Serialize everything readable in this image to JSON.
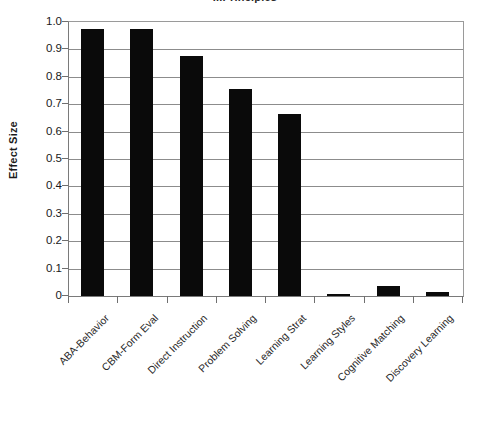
{
  "chart_data": {
    "type": "bar",
    "title": "...Principles",
    "xlabel": "",
    "ylabel": "Effect Size",
    "ylim": [
      0,
      1.0
    ],
    "grid": true,
    "legend": "none",
    "categories": [
      "ABA-Behavior",
      "CBM-Form Eval",
      "Direct Instruction",
      "Problem Solving",
      "Learning Strat",
      "Learning Styles",
      "Cognitive Matching",
      "Discovery Learning"
    ],
    "values": [
      0.975,
      0.975,
      0.875,
      0.755,
      0.665,
      0.008,
      0.038,
      0.015
    ],
    "ytick_labels": [
      "1.0",
      "0.9",
      "0.8",
      "0.7",
      "0.6",
      "0.5",
      "0.4",
      "0.3",
      "0.2",
      "0.1",
      "0"
    ],
    "ytick_values": [
      1.0,
      0.9,
      0.8,
      0.7,
      0.6,
      0.5,
      0.4,
      0.3,
      0.2,
      0.1,
      0
    ],
    "bar_color": "#0a0a0a",
    "grid_color": "#8c8c8c",
    "axis_color": "#7a7a7a",
    "background": "#ffffff"
  }
}
